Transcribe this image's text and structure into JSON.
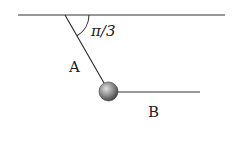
{
  "diagram": {
    "type": "physics-pendulum-two-strings",
    "ceiling": {
      "x1": 18,
      "y1": 15,
      "x2": 225,
      "y2": 15
    },
    "string_a": {
      "label": "A",
      "x1": 65,
      "y1": 15,
      "x2": 104,
      "y2": 83
    },
    "string_b": {
      "label": "B",
      "x1": 117,
      "y1": 92,
      "x2": 200,
      "y2": 92
    },
    "ball": {
      "cx": 108.5,
      "cy": 91.5,
      "r": 9.5
    },
    "angle": {
      "label": "π/3",
      "value_rad": "π/3"
    },
    "colors": {
      "line": "#333333",
      "ball_light": "#c8c8c8",
      "ball_dark": "#4a4a4a",
      "text": "#222222"
    }
  },
  "labels": {
    "string_a": "A",
    "string_b": "B",
    "angle": "π/3"
  }
}
